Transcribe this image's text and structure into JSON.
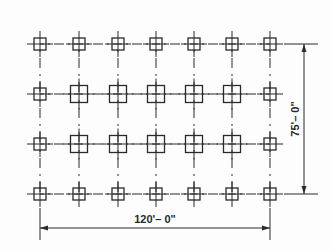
{
  "diagram": {
    "type": "column-grid-plan",
    "colors": {
      "line": "#2a2a2a",
      "background": "#fdfdfd"
    },
    "grid": {
      "columns_x": [
        40,
        79,
        118,
        156,
        194,
        232,
        270
      ],
      "rows_y": [
        44,
        94,
        144,
        194
      ],
      "column_sizes": [
        [
          "small",
          "small",
          "small",
          "small",
          "small",
          "small",
          "small"
        ],
        [
          "small",
          "large",
          "large",
          "large",
          "large",
          "large",
          "small"
        ],
        [
          "small",
          "large",
          "large",
          "large",
          "large",
          "large",
          "small"
        ],
        [
          "small",
          "small",
          "small",
          "small",
          "small",
          "small",
          "small"
        ]
      ],
      "small_size": 12,
      "large_size": 17
    },
    "dimensions": {
      "horizontal": {
        "label": "120'– 0\"",
        "x1": 40,
        "x2": 270,
        "y": 228
      },
      "vertical": {
        "label": "75'– 0\"",
        "x": 304,
        "y1": 44,
        "y2": 194
      }
    }
  }
}
